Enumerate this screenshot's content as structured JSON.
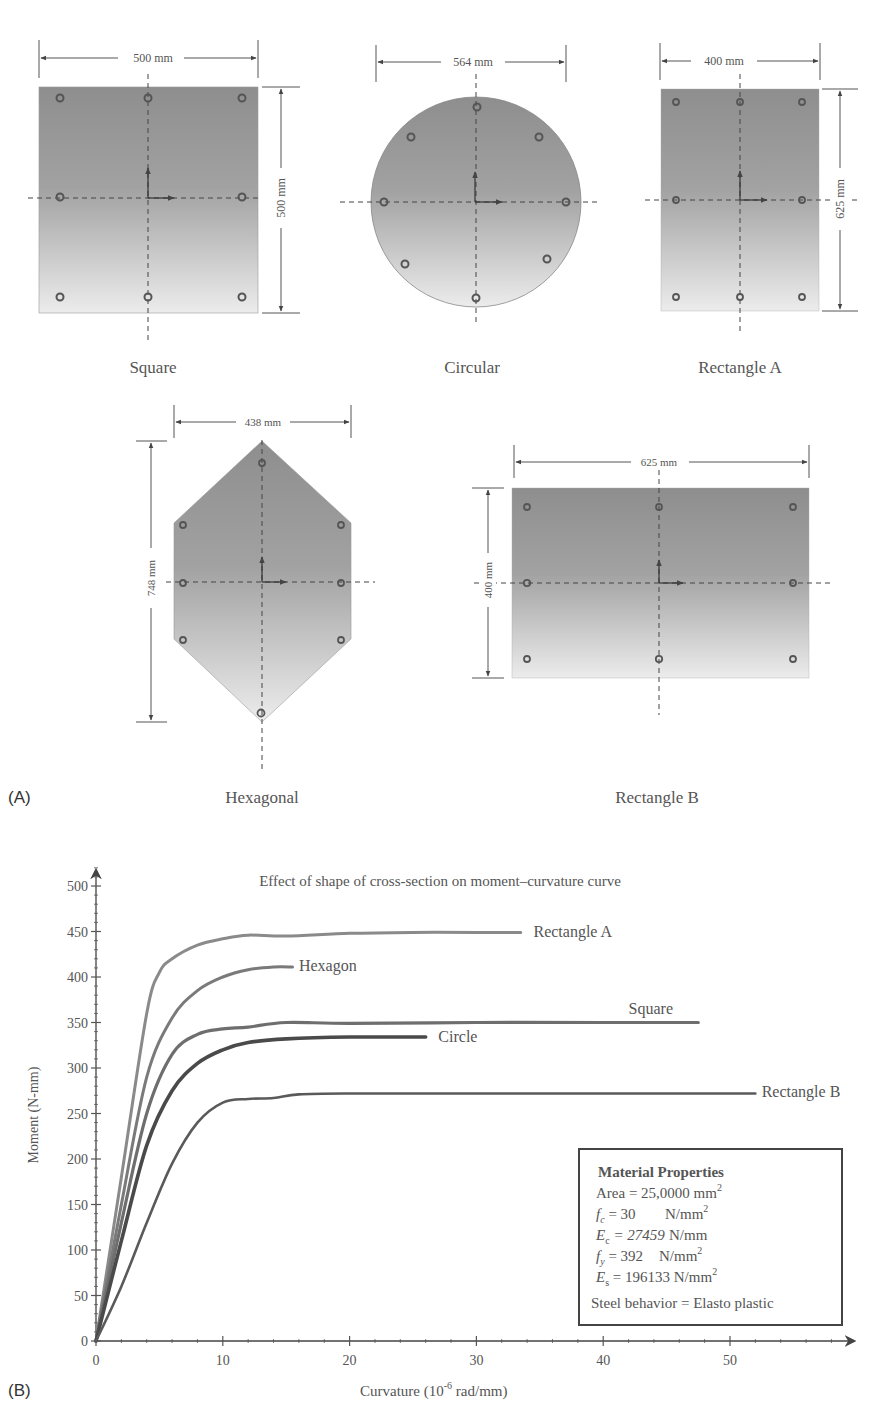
{
  "panel_a": {
    "label": "(A)",
    "sections": [
      {
        "name": "Square",
        "width_dim": "500 mm",
        "height_dim": "500 mm"
      },
      {
        "name": "Circular",
        "width_dim": "564 mm"
      },
      {
        "name": "Rectangle A",
        "width_dim": "400 mm",
        "height_dim": "625 mm"
      },
      {
        "name": "Hexagonal",
        "width_dim": "438 mm",
        "height_dim": "748 mm"
      },
      {
        "name": "Rectangle B",
        "width_dim": "625 mm",
        "height_dim": "400 mm"
      }
    ]
  },
  "panel_b": {
    "label": "(B)",
    "material_box": {
      "title": "Material Properties",
      "area": "Area = 25,0000 mm",
      "area_sup": "2",
      "fc_sym": "f",
      "fc_sub": "c",
      "fc_val": " = 30",
      "fc_unit": "N/mm",
      "fc_sup": "2",
      "ec_sym": "E",
      "ec_sub": "c",
      "ec_val": " = 27459",
      "ec_unit": "N/mm",
      "fy_sym": "f",
      "fy_sub": "y",
      "fy_val": " = 392",
      "fy_unit": "N/mm",
      "fy_sup": "2",
      "es_sym": "E",
      "es_sub": "s",
      "es_val": " = 196133 N/mm",
      "es_sup": "2",
      "steel": "Steel behavior = Elasto plastic"
    }
  },
  "chart_data": {
    "type": "line",
    "title": "Effect of shape of cross-section on moment–curvature curve",
    "xlabel": "Curvature (10⁻⁶ rad/mm)",
    "xlabel_main": "Curvature (10",
    "xlabel_sup": "-6",
    "xlabel_tail": " rad/mm)",
    "ylabel": "Moment (N-mm)",
    "xlim": [
      0,
      58
    ],
    "ylim": [
      0,
      530
    ],
    "xticks": [
      0,
      10,
      20,
      30,
      40,
      50
    ],
    "yticks": [
      0,
      50,
      100,
      150,
      200,
      250,
      300,
      350,
      400,
      450,
      500
    ],
    "grid": false,
    "legend_position": "inline labels at curve ends",
    "series": [
      {
        "name": "Rectangle A",
        "color": "#8a8a8a",
        "width": 3,
        "x": [
          0,
          2,
          4,
          5,
          6,
          8,
          10,
          12,
          15,
          20,
          25,
          30,
          33.5
        ],
        "y": [
          0,
          180,
          360,
          405,
          420,
          435,
          442,
          446,
          445,
          448,
          449,
          449,
          449
        ]
      },
      {
        "name": "Hexagon",
        "color": "#7a7a7a",
        "width": 3,
        "x": [
          0,
          2,
          4,
          6,
          8,
          10,
          12,
          14,
          15.5
        ],
        "y": [
          0,
          150,
          290,
          355,
          385,
          400,
          408,
          411,
          411
        ]
      },
      {
        "name": "Square",
        "color": "#6e6e6e",
        "width": 3.2,
        "x": [
          0,
          2,
          4,
          6,
          8,
          10,
          12,
          15,
          20,
          30,
          40,
          47.5
        ],
        "y": [
          0,
          130,
          250,
          315,
          337,
          343,
          345,
          350,
          349,
          350,
          350,
          350
        ]
      },
      {
        "name": "Circle",
        "color": "#4a4a4a",
        "width": 3.6,
        "x": [
          0,
          2,
          4,
          6,
          8,
          10,
          12,
          15,
          20,
          26
        ],
        "y": [
          0,
          110,
          215,
          275,
          305,
          320,
          328,
          332,
          334,
          334
        ]
      },
      {
        "name": "Rectangle B",
        "color": "#5a5a5a",
        "width": 2.6,
        "x": [
          0,
          2,
          4,
          6,
          8,
          10,
          12,
          14,
          16,
          20,
          30,
          40,
          52
        ],
        "y": [
          0,
          60,
          130,
          195,
          240,
          262,
          266,
          267,
          271,
          272,
          272,
          272,
          272
        ]
      }
    ],
    "annotations": [
      {
        "text": "Rectangle A",
        "x": 34.5,
        "y": 450
      },
      {
        "text": "Hexagon",
        "x": 16,
        "y": 412
      },
      {
        "text": "Square",
        "x": 42,
        "y": 365
      },
      {
        "text": "Circle",
        "x": 27,
        "y": 334
      },
      {
        "text": "Rectangle B",
        "x": 52.5,
        "y": 274
      }
    ]
  }
}
